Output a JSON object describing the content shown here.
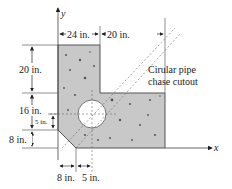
{
  "diagram": {
    "axes": {
      "x_label": "x",
      "y_label": "y"
    },
    "dimensions": {
      "top_left_width": "24 in.",
      "top_right_width": "20 in.",
      "left_upper_height": "20 in.",
      "left_middle_height": "16 in.",
      "hole_offset_height": "5 in.",
      "left_lower_height": "8 in.",
      "bottom_chamfer_width": "8 in.",
      "bottom_hole_offset": "5 in."
    },
    "annotation": {
      "line1": "Cirular pipe",
      "line2": "chase cutout"
    },
    "colors": {
      "concrete_fill": "#c8c8c8",
      "outline": "#555555",
      "text": "#222222",
      "hole": "#ffffff"
    }
  }
}
